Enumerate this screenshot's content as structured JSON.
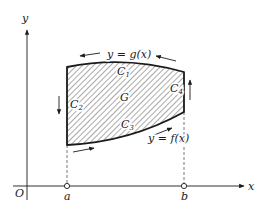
{
  "diagram": {
    "type": "region-boundary-orientation",
    "axes": {
      "x_label": "x",
      "y_label": "y",
      "origin_label": "O"
    },
    "points": [
      {
        "label": "a",
        "marker": "open-circle"
      },
      {
        "label": "b",
        "marker": "open-circle"
      }
    ],
    "curves": {
      "upper": {
        "label": "y = g(x)",
        "boundary_label": "C",
        "boundary_sub": "1",
        "direction": "right-to-left"
      },
      "left": {
        "boundary_label": "C",
        "boundary_sub": "2",
        "direction": "downward"
      },
      "lower": {
        "label": "y = f(x)",
        "boundary_label": "C",
        "boundary_sub": "3",
        "direction": "left-to-right"
      },
      "right": {
        "boundary_label": "C",
        "boundary_sub": "4",
        "direction": "upward"
      }
    },
    "region": {
      "label": "G",
      "fill": "hatched"
    },
    "colors": {
      "ink": "#1a1a1a",
      "hatch": "#555555",
      "background": "#ffffff"
    }
  }
}
